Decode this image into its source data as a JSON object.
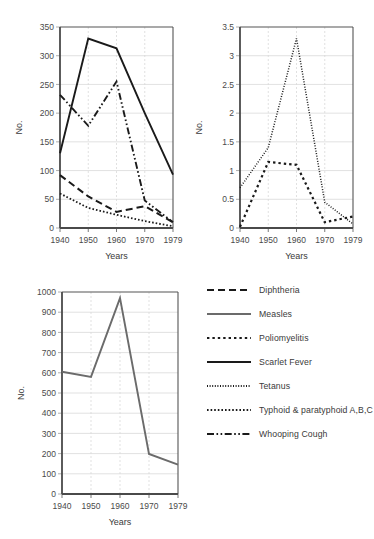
{
  "figure": {
    "background": "#ffffff",
    "axis_label_y": "No.",
    "axis_label_x": "Years",
    "line_color_dark": "#1a1a1a",
    "line_color_gray": "#6b6b6b",
    "grid_color": "#d9d9d9",
    "frame_color": "#555555"
  },
  "legend": {
    "items": [
      {
        "label": "Diphtheria",
        "style": "dashed",
        "color": "#1a1a1a"
      },
      {
        "label": "Measles",
        "style": "solid-gray",
        "color": "#6b6b6b"
      },
      {
        "label": "Poliomyelitis",
        "style": "dotted-coarse",
        "color": "#1a1a1a"
      },
      {
        "label": "Scarlet Fever",
        "style": "solid",
        "color": "#1a1a1a"
      },
      {
        "label": "Tetanus",
        "style": "dotted-fine",
        "color": "#1a1a1a"
      },
      {
        "label": "Typhoid & paratyphoid A,B,C",
        "style": "dotted-med",
        "color": "#1a1a1a"
      },
      {
        "label": "Whooping Cough",
        "style": "dash-dot-dot",
        "color": "#1a1a1a"
      }
    ]
  },
  "chart_data": [
    {
      "id": "chart-scarlet",
      "type": "line",
      "title": "",
      "xlabel": "Years",
      "ylabel": "No.",
      "x": [
        1940,
        1950,
        1960,
        1970,
        1979
      ],
      "categories": [
        "1940",
        "1950",
        "1960",
        "1970",
        "1979"
      ],
      "xticklabels": [
        "1940",
        "1950",
        "1960",
        "1970",
        "1979"
      ],
      "ylim": [
        0,
        350
      ],
      "yticks": [
        0,
        50,
        100,
        150,
        200,
        250,
        300,
        350
      ],
      "yticklabels": [
        "0",
        "50",
        "100",
        "150",
        "200",
        "250",
        "300",
        "350"
      ],
      "grid": true,
      "legend_position": "external-right",
      "series": [
        {
          "name": "Scarlet Fever",
          "style": "solid",
          "values": [
            130,
            330,
            313,
            200,
            93
          ]
        },
        {
          "name": "Whooping Cough",
          "style": "dash-dot-dot",
          "values": [
            232,
            178,
            255,
            48,
            10
          ]
        },
        {
          "name": "Diphtheria",
          "style": "dashed",
          "values": [
            92,
            55,
            28,
            38,
            10
          ]
        },
        {
          "name": "Typhoid & paratyphoid A,B,C",
          "style": "dotted-med",
          "values": [
            60,
            35,
            23,
            12,
            3
          ]
        }
      ]
    },
    {
      "id": "chart-tetanus",
      "type": "line",
      "title": "",
      "xlabel": "Years",
      "ylabel": "No.",
      "x": [
        1940,
        1950,
        1960,
        1970,
        1979
      ],
      "categories": [
        "1940",
        "1950",
        "1960",
        "1970",
        "1979"
      ],
      "xticklabels": [
        "1940",
        "1950",
        "1960",
        "1970",
        "1979"
      ],
      "ylim": [
        0,
        3.5
      ],
      "yticks": [
        0,
        0.5,
        1,
        1.5,
        2,
        2.5,
        3,
        3.5
      ],
      "yticklabels": [
        "0",
        "0.5",
        "1",
        "1.5",
        "2",
        "2.5",
        "3",
        "3.5"
      ],
      "grid": true,
      "legend_position": "external-right",
      "series": [
        {
          "name": "Tetanus",
          "style": "dotted-fine",
          "values": [
            0.7,
            1.4,
            3.3,
            0.45,
            0.07
          ]
        },
        {
          "name": "Poliomyelitis",
          "style": "dotted-coarse",
          "values": [
            0.02,
            1.15,
            1.1,
            0.1,
            0.2
          ]
        }
      ]
    },
    {
      "id": "chart-measles",
      "type": "line",
      "title": "",
      "xlabel": "Years",
      "ylabel": "No.",
      "x": [
        1940,
        1950,
        1960,
        1970,
        1979
      ],
      "categories": [
        "1940",
        "1950",
        "1960",
        "1970",
        "1979"
      ],
      "xticklabels": [
        "1940",
        "1950",
        "1960",
        "1970",
        "1979"
      ],
      "ylim": [
        0,
        1000
      ],
      "yticks": [
        0,
        100,
        200,
        300,
        400,
        500,
        600,
        700,
        800,
        900,
        1000
      ],
      "yticklabels": [
        "0",
        "100",
        "200",
        "300",
        "400",
        "500",
        "600",
        "700",
        "800",
        "900",
        "1000"
      ],
      "grid": true,
      "legend_position": "external-right",
      "series": [
        {
          "name": "Measles",
          "style": "solid-gray",
          "values": [
            605,
            580,
            970,
            198,
            145
          ]
        }
      ]
    }
  ]
}
